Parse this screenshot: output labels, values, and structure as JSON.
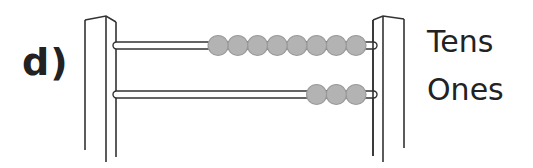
{
  "question_label": "d)",
  "rows": [
    {
      "label": "Tens",
      "beads": 8
    },
    {
      "label": "Ones",
      "beads": 3
    }
  ],
  "colors": {
    "bead_fill": "#b3b3b3",
    "bead_stroke": "#9a9a9a",
    "line": "#333333"
  }
}
